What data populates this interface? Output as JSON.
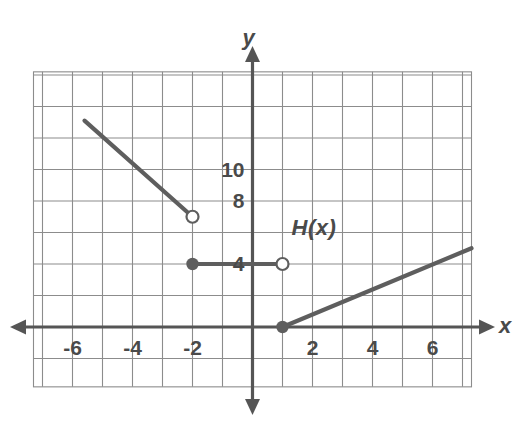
{
  "figure": {
    "kind": "coordinate-grid-graph",
    "background": "#ffffff",
    "grid_color": "#8c8c8c",
    "axis_color": "#555555",
    "curve_color": "#5e5e5e",
    "text_color": "#4a4a4a"
  },
  "axes": {
    "x_label": "x",
    "y_label": "y",
    "x_ticks": [
      "-6",
      "-4",
      "-2",
      "2",
      "4",
      "6"
    ],
    "x_tick_values": [
      -6,
      -4,
      -2,
      2,
      4,
      6
    ],
    "y_ticks": [
      "4",
      "8",
      "10"
    ],
    "y_tick_values": [
      4,
      8,
      10
    ],
    "x_range": [
      -7.2,
      7.2
    ],
    "y_range": [
      -4,
      14
    ],
    "grid": "on",
    "x_grid_step": 1,
    "y_grid_step": 2
  },
  "annotations": [
    {
      "name": "function-label",
      "text": "H(x)",
      "x": 1.3,
      "y": 6.2
    }
  ],
  "chart_data": {
    "type": "line",
    "title": "",
    "xlabel": "x",
    "ylabel": "y",
    "xlim": [
      -7.2,
      7.2
    ],
    "ylim": [
      -4,
      14
    ],
    "grid": true,
    "legend": "none",
    "series": [
      {
        "name": "branch-1-decreasing",
        "points": [
          [
            -5.6,
            13.1
          ],
          [
            -2,
            7
          ]
        ],
        "left_endpoint": "open-off-grid",
        "right_endpoint": "open"
      },
      {
        "name": "branch-2-constant",
        "points": [
          [
            -2,
            4
          ],
          [
            1,
            4
          ]
        ],
        "left_endpoint": "closed",
        "right_endpoint": "open"
      },
      {
        "name": "branch-3-increasing",
        "points": [
          [
            1,
            0
          ],
          [
            7.3,
            5
          ]
        ],
        "left_endpoint": "closed",
        "right_endpoint": "open-off-grid"
      }
    ],
    "markers": [
      {
        "name": "open-circle-at-neg2-7",
        "x": -2,
        "y": 7,
        "filled": false
      },
      {
        "name": "closed-circle-at-neg2-4",
        "x": -2,
        "y": 4,
        "filled": true
      },
      {
        "name": "open-circle-at-1-4",
        "x": 1,
        "y": 4,
        "filled": false
      },
      {
        "name": "closed-circle-at-1-0",
        "x": 1,
        "y": 0,
        "filled": true
      }
    ]
  }
}
